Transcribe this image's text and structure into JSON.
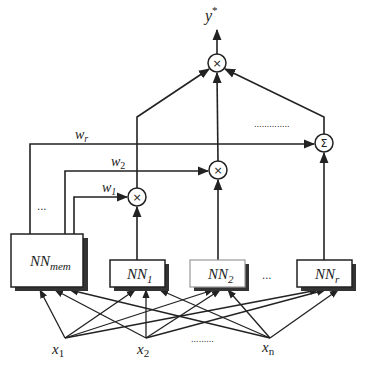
{
  "output": {
    "label": "y",
    "superscript": "*"
  },
  "operators": {
    "top_product": "×",
    "product_2": "×",
    "product_1": "×",
    "sum": "Σ"
  },
  "weights": {
    "w_r": {
      "base": "w",
      "sub": "r"
    },
    "w_2": {
      "base": "w",
      "sub": "2"
    },
    "w_1": {
      "base": "w",
      "sub": "1"
    }
  },
  "networks": {
    "memory": {
      "base": "NN",
      "sub": "mem"
    },
    "nn1": {
      "base": "NN",
      "sub": "1"
    },
    "nn2": {
      "base": "NN",
      "sub": "2"
    },
    "nnr": {
      "base": "NN",
      "sub": "r"
    }
  },
  "inputs": {
    "x1": {
      "base": "x",
      "sub": "1"
    },
    "x2": {
      "base": "x",
      "sub": "2"
    },
    "xn": {
      "base": "x",
      "sub": "n"
    }
  },
  "ellipses": {
    "weights_gap": "...",
    "networks_gap": "...",
    "inputs_gap": ".........",
    "sum_gap": ".............."
  }
}
